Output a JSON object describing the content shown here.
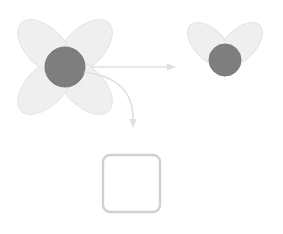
{
  "canvas": {
    "width": 283,
    "height": 234,
    "background": "#ffffff",
    "title": "flower-transform-diagram"
  },
  "palette": {
    "petal_fill": "#f2f2f2",
    "petal_stroke": "#e4e4e4",
    "petal_stripe": "#e8e8e8",
    "center_fill": "#808080",
    "center_stroke": "#787878",
    "arrow_color": "#e0e0e0",
    "square_stroke": "#d0d0d0",
    "square_fill": "#ffffff"
  },
  "source_flower": {
    "name": "large-flower",
    "center_x": 65,
    "center_y": 67,
    "center_radius": 20,
    "petal_count": 4,
    "petal_length": 34,
    "petal_width": 19,
    "petal_offset": 28,
    "petal_angles": [
      45,
      135,
      225,
      315
    ],
    "petal_labels": [
      "petal-top-right",
      "petal-top-left",
      "petal-bottom-left",
      "petal-bottom-right"
    ]
  },
  "result_flower": {
    "name": "small-flower",
    "center_x": 225,
    "center_y": 60,
    "center_radius": 16,
    "petal_count": 2,
    "petal_length": 27,
    "petal_width": 15,
    "petal_offset": 22,
    "petal_angles": [
      45,
      315
    ],
    "petal_labels": [
      "petal-top-right",
      "petal-bottom-right"
    ]
  },
  "horizontal_arrow": {
    "name": "transform-arrow-right",
    "x1": 92,
    "y1": 67,
    "x2": 176,
    "y2": 67,
    "stroke_width": 1.6,
    "head_length": 9,
    "head_width": 7,
    "label": ""
  },
  "curved_arrow": {
    "name": "transform-arrow-curved",
    "start_x": 84,
    "start_y": 72,
    "ctrl_x": 134,
    "ctrl_y": 78,
    "end_x": 133,
    "end_y": 128,
    "stroke_width": 1.6,
    "head_length": 9,
    "head_width": 7,
    "label": ""
  },
  "target_square": {
    "name": "empty-result-box",
    "x": 103,
    "y": 155,
    "width": 57,
    "height": 57,
    "corner_radius": 7,
    "stroke_width": 2.4,
    "label": ""
  }
}
